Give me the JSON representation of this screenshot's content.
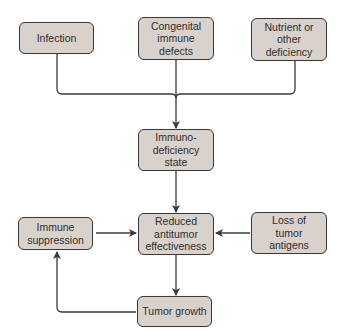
{
  "diagram": {
    "type": "flowchart",
    "colors": {
      "box_fill": "#d9d1cc",
      "box_border": "#3a3a3a",
      "line": "#3a3a3a",
      "background": "#ffffff"
    },
    "nodes": {
      "infection": {
        "label": "Infection"
      },
      "congenital": {
        "label": "Congenital\nimmune\ndefects"
      },
      "nutrient": {
        "label": "Nutrient or\nother\ndeficiency"
      },
      "immunodeficiency": {
        "label": "Immuno-\ndeficiency\nstate"
      },
      "immune_suppression": {
        "label": "Immune\nsuppression"
      },
      "reduced": {
        "label": "Reduced\nantitumor\neffectiveness"
      },
      "loss_antigens": {
        "label": "Loss of\ntumor\nantigens"
      },
      "tumor_growth": {
        "label": "Tumor growth"
      }
    },
    "edges": [
      {
        "from": "infection",
        "to": "immunodeficiency"
      },
      {
        "from": "congenital",
        "to": "immunodeficiency"
      },
      {
        "from": "nutrient",
        "to": "immunodeficiency"
      },
      {
        "from": "immunodeficiency",
        "to": "reduced"
      },
      {
        "from": "immune_suppression",
        "to": "reduced"
      },
      {
        "from": "loss_antigens",
        "to": "reduced"
      },
      {
        "from": "reduced",
        "to": "tumor_growth"
      },
      {
        "from": "tumor_growth",
        "to": "immune_suppression"
      }
    ]
  }
}
